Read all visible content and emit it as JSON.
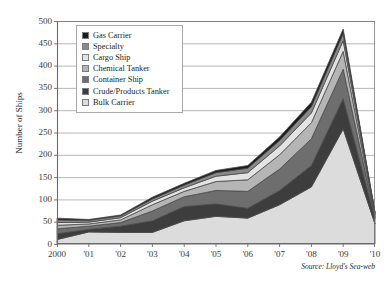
{
  "chart_data": {
    "type": "area",
    "stacked": true,
    "title": "",
    "xlabel": "",
    "ylabel": "Number of Ships",
    "categories": [
      "2000",
      "'01",
      "'02",
      "'03",
      "'04",
      "'05",
      "'06",
      "'07",
      "'08",
      "'09",
      "'10"
    ],
    "x_values": [
      2000,
      2001,
      2002,
      2003,
      2004,
      2005,
      2006,
      2007,
      2008,
      2009,
      2010
    ],
    "ylim": [
      0,
      500
    ],
    "yticks": [
      0,
      50,
      100,
      150,
      200,
      250,
      300,
      350,
      400,
      450,
      500
    ],
    "grid": "horizontal",
    "legend_position": "top-left-inside",
    "series": [
      {
        "name": "Bulk Carrier",
        "color": "#dcdcdc",
        "values": [
          10,
          27,
          26,
          26,
          52,
          62,
          58,
          88,
          128,
          258,
          45
        ]
      },
      {
        "name": "Crude/Products Tanker",
        "color": "#3d3d3d",
        "values": [
          13,
          6,
          14,
          26,
          32,
          28,
          22,
          32,
          48,
          68,
          12
        ]
      },
      {
        "name": "Container Ship",
        "color": "#6e6e6e",
        "values": [
          11,
          7,
          8,
          22,
          22,
          30,
          38,
          48,
          60,
          66,
          4
        ]
      },
      {
        "name": "Chemical Tanker",
        "color": "#b5b5b5",
        "values": [
          8,
          5,
          6,
          14,
          12,
          20,
          26,
          32,
          36,
          40,
          4
        ]
      },
      {
        "name": "Cargo Ship",
        "color": "#e3e3e3",
        "values": [
          6,
          4,
          5,
          8,
          8,
          12,
          16,
          20,
          22,
          24,
          3
        ]
      },
      {
        "name": "Specialty",
        "color": "#8a8a8a",
        "values": [
          6,
          4,
          4,
          5,
          6,
          8,
          10,
          12,
          14,
          16,
          2
        ]
      },
      {
        "name": "Gas Carrier",
        "color": "#1c1c1c",
        "values": [
          4,
          2,
          2,
          4,
          4,
          5,
          6,
          8,
          10,
          10,
          1
        ]
      }
    ],
    "totals": [
      58,
      55,
      65,
      105,
      136,
      165,
      176,
      240,
      318,
      482,
      71
    ],
    "source": "Source: Lloyd's Sea-web"
  },
  "legend": {
    "items": [
      {
        "label": "Gas Carrier",
        "color": "#1c1c1c"
      },
      {
        "label": "Specialty",
        "color": "#8a8a8a"
      },
      {
        "label": "Cargo Ship",
        "color": "#e3e3e3"
      },
      {
        "label": "Chemical Tanker",
        "color": "#b5b5b5"
      },
      {
        "label": "Container Ship",
        "color": "#6e6e6e"
      },
      {
        "label": "Crude/Products Tanker",
        "color": "#3d3d3d"
      },
      {
        "label": "Bulk Carrier",
        "color": "#dcdcdc"
      }
    ]
  },
  "axes": {
    "y_title": "Number of Ships",
    "y_ticks": [
      "500",
      "450",
      "400",
      "350",
      "300",
      "250",
      "200",
      "150",
      "100",
      "50",
      "0"
    ],
    "x_ticks": [
      "2000",
      "'01",
      "'02",
      "'03",
      "'04",
      "'05",
      "'06",
      "'07",
      "'08",
      "'09",
      "'10"
    ]
  },
  "footer": {
    "source": "Source: Lloyd's Sea-web"
  },
  "colors": {
    "axis": "#6b6b6b",
    "grid": "#9a9a9a",
    "outline": "#4a4a4a",
    "background": "#ffffff"
  }
}
